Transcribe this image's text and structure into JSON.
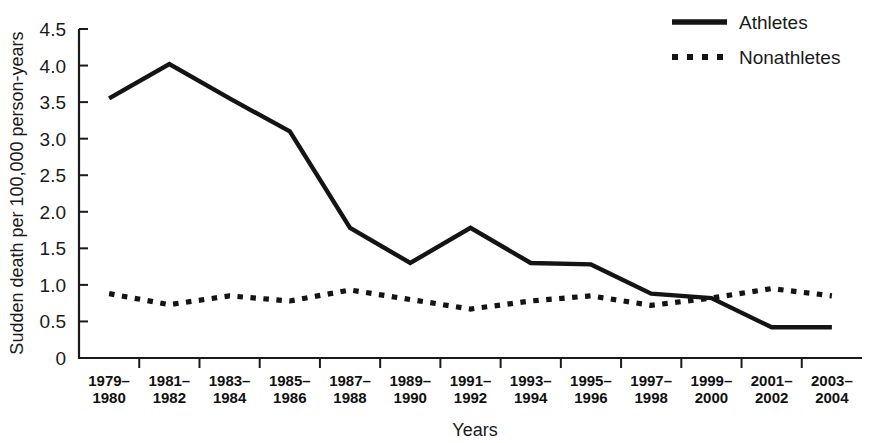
{
  "chart_data": {
    "type": "line",
    "title": "",
    "xlabel": "Years",
    "ylabel": "Sudden death per 100,000 person-years",
    "categories": [
      "1979–1980",
      "1981–1982",
      "1983–1984",
      "1985–1986",
      "1987–1988",
      "1989–1990",
      "1991–1992",
      "1993–1994",
      "1995–1996",
      "1997–1998",
      "1999–2000",
      "2001–2002",
      "2003–2004"
    ],
    "series": [
      {
        "name": "Athletes",
        "style": "solid",
        "color": "#141414",
        "values": [
          3.55,
          4.02,
          3.55,
          3.1,
          1.78,
          1.3,
          1.78,
          1.3,
          1.28,
          0.88,
          0.82,
          0.42,
          0.42
        ]
      },
      {
        "name": "Nonathletes",
        "style": "dotted",
        "color": "#141414",
        "values": [
          0.88,
          0.73,
          0.85,
          0.78,
          0.93,
          0.8,
          0.67,
          0.78,
          0.85,
          0.72,
          0.82,
          0.95,
          0.85
        ]
      }
    ],
    "ylim": [
      0,
      4.5
    ],
    "yticks": [
      0,
      0.5,
      1.0,
      1.5,
      2.0,
      2.5,
      3.0,
      3.5,
      4.0,
      4.5
    ],
    "ytick_labels": [
      "0",
      "0.5",
      "1.0",
      "1.5",
      "2.0",
      "2.5",
      "3.0",
      "3.5",
      "4.0",
      "4.5"
    ],
    "grid": false,
    "legend_position": "top-right"
  },
  "legend": {
    "entries": [
      {
        "label": "Athletes"
      },
      {
        "label": "Nonathletes"
      }
    ]
  },
  "axes": {
    "x_title": "Years",
    "y_title": "Sudden death per 100,000 person-years"
  }
}
